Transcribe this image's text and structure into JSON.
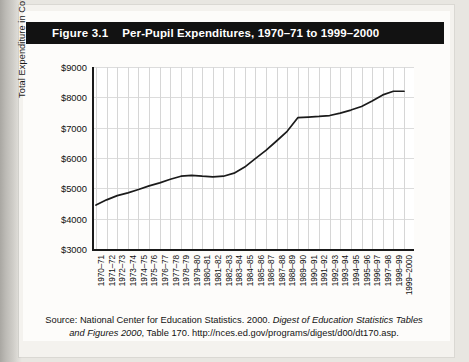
{
  "figure": {
    "label": "Figure 3.1",
    "title": "Per-Pupil Expenditures, 1970–71 to 1999–2000"
  },
  "source": {
    "line1_plain_a": "Source: National Center for Education Statistics. 2000. ",
    "line1_italic": "Digest of Education Statistics Tables",
    "line2_italic": "and Figures 2000",
    "line2_plain": ", Table 170. http://nces.ed.gov/programs/digest/d00/dt170.asp."
  },
  "colors": {
    "title_bar_bg": "#121212",
    "title_bar_text": "#ffffff",
    "page_bg": "#b9b7b2",
    "sheet_bg": "#fdfcfa",
    "plot_bg": "#ffffff",
    "axis": "#1a1a1a",
    "gridline": "#d6d6d6",
    "series": "#1b1b1b"
  },
  "chart_data": {
    "type": "line",
    "title": "Per-Pupil Expenditures, 1970–71 to 1999–2000",
    "xlabel": "",
    "ylabel": "Total Expenditure in Constant 1999–2000 Dollars",
    "ylim": [
      3000,
      9000
    ],
    "ytick_step": 1000,
    "ytick_labels": [
      "$9000",
      "$8000",
      "$7000",
      "$6000",
      "$5000",
      "$4000",
      "$3000"
    ],
    "ytick_values": [
      9000,
      8000,
      7000,
      6000,
      5000,
      4000,
      3000
    ],
    "grid": true,
    "legend": "none",
    "categories": [
      "1970–71",
      "1971–72",
      "1972–73",
      "1973–74",
      "1974–75",
      "1975–76",
      "1976–77",
      "1977–78",
      "1978–79",
      "1979–80",
      "1980–81",
      "1981–82",
      "1982–83",
      "1983–84",
      "1984–85",
      "1985–86",
      "1986–87",
      "1987–88",
      "1988–89",
      "1989–90",
      "1990–91",
      "1991–92",
      "1992–93",
      "1993–94",
      "1994–95",
      "1995–96",
      "1996–97",
      "1997–98",
      "1998–99",
      "1999–2000"
    ],
    "values": [
      4450,
      4620,
      4760,
      4850,
      4960,
      5080,
      5180,
      5300,
      5400,
      5430,
      5400,
      5380,
      5400,
      5500,
      5700,
      5980,
      6250,
      6560,
      6880,
      7330,
      7350,
      7370,
      7400,
      7480,
      7580,
      7700,
      7880,
      8080,
      8200,
      8200
    ],
    "series_name": "Per-pupil expenditure (constant 1999–2000 dollars)"
  }
}
